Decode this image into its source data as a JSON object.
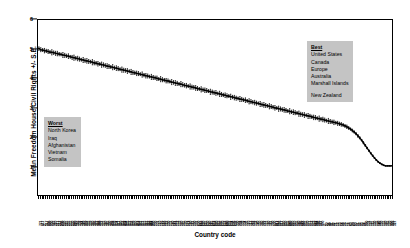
{
  "chart_data": {
    "type": "scatter",
    "title": "",
    "xlabel": "Country code",
    "ylabel": "Mean Freedom House Civil Rights +/- S.E.",
    "ylim": [
      0,
      6
    ],
    "yticks": [
      1,
      2,
      3,
      4,
      5,
      6
    ],
    "grid": false,
    "legend_position": "none",
    "n_points": 192,
    "series": [
      {
        "name": "Mean Freedom House Civil Rights +/- S.E.",
        "marker": "filled-square",
        "errorbars": true,
        "values": [
          5.02,
          4.98,
          4.97,
          4.95,
          4.94,
          4.92,
          4.9,
          4.89,
          4.88,
          4.86,
          4.85,
          4.83,
          4.82,
          4.8,
          4.79,
          4.77,
          4.76,
          4.74,
          4.72,
          4.71,
          4.69,
          4.68,
          4.66,
          4.64,
          4.63,
          4.61,
          4.6,
          4.58,
          4.57,
          4.55,
          4.53,
          4.52,
          4.5,
          4.49,
          4.47,
          4.46,
          4.44,
          4.42,
          4.41,
          4.39,
          4.38,
          4.36,
          4.35,
          4.33,
          4.31,
          4.3,
          4.28,
          4.27,
          4.25,
          4.24,
          4.22,
          4.2,
          4.19,
          4.17,
          4.16,
          4.14,
          4.13,
          4.11,
          4.09,
          4.08,
          4.06,
          4.05,
          4.03,
          4.02,
          4.0,
          3.98,
          3.97,
          3.95,
          3.94,
          3.92,
          3.91,
          3.89,
          3.87,
          3.86,
          3.84,
          3.83,
          3.81,
          3.8,
          3.78,
          3.76,
          3.75,
          3.73,
          3.72,
          3.7,
          3.69,
          3.67,
          3.65,
          3.64,
          3.62,
          3.61,
          3.59,
          3.58,
          3.56,
          3.54,
          3.53,
          3.51,
          3.5,
          3.48,
          3.47,
          3.45,
          3.43,
          3.42,
          3.4,
          3.39,
          3.37,
          3.36,
          3.34,
          3.32,
          3.31,
          3.29,
          3.28,
          3.26,
          3.25,
          3.23,
          3.21,
          3.2,
          3.18,
          3.17,
          3.15,
          3.14,
          3.12,
          3.1,
          3.09,
          3.07,
          3.06,
          3.04,
          3.03,
          3.01,
          2.99,
          2.98,
          2.96,
          2.95,
          2.93,
          2.92,
          2.9,
          2.88,
          2.87,
          2.85,
          2.84,
          2.82,
          2.81,
          2.79,
          2.77,
          2.76,
          2.74,
          2.73,
          2.71,
          2.7,
          2.68,
          2.66,
          2.65,
          2.63,
          2.62,
          2.6,
          2.59,
          2.57,
          2.55,
          2.54,
          2.52,
          2.51,
          2.49,
          2.48,
          2.46,
          2.44,
          2.42,
          2.4,
          2.37,
          2.34,
          2.3,
          2.26,
          2.21,
          2.16,
          2.1,
          2.03,
          1.96,
          1.88,
          1.79,
          1.7,
          1.61,
          1.52,
          1.43,
          1.35,
          1.27,
          1.2,
          1.14,
          1.09,
          1.05,
          1.02,
          1.0,
          1.0,
          1.0,
          1.0
        ],
        "errors": [
          0.06,
          0.07,
          0.05,
          0.08,
          0.06,
          0.07,
          0.05,
          0.09,
          0.06,
          0.07,
          0.08,
          0.06,
          0.05,
          0.09,
          0.07,
          0.06,
          0.08,
          0.05,
          0.07,
          0.09,
          0.06,
          0.08,
          0.07,
          0.05,
          0.09,
          0.06,
          0.08,
          0.07,
          0.05,
          0.09,
          0.07,
          0.06,
          0.08,
          0.05,
          0.09,
          0.07,
          0.06,
          0.08,
          0.07,
          0.05,
          0.09,
          0.06,
          0.08,
          0.07,
          0.05,
          0.09,
          0.07,
          0.06,
          0.08,
          0.05,
          0.09,
          0.07,
          0.06,
          0.08,
          0.07,
          0.05,
          0.09,
          0.06,
          0.08,
          0.07,
          0.05,
          0.09,
          0.07,
          0.06,
          0.08,
          0.05,
          0.09,
          0.07,
          0.06,
          0.08,
          0.07,
          0.05,
          0.09,
          0.06,
          0.08,
          0.07,
          0.05,
          0.09,
          0.07,
          0.06,
          0.08,
          0.05,
          0.09,
          0.07,
          0.06,
          0.08,
          0.07,
          0.05,
          0.09,
          0.06,
          0.08,
          0.07,
          0.05,
          0.09,
          0.07,
          0.06,
          0.08,
          0.05,
          0.09,
          0.07,
          0.06,
          0.08,
          0.07,
          0.05,
          0.09,
          0.06,
          0.08,
          0.07,
          0.05,
          0.09,
          0.07,
          0.06,
          0.08,
          0.05,
          0.09,
          0.07,
          0.06,
          0.08,
          0.07,
          0.05,
          0.09,
          0.06,
          0.08,
          0.07,
          0.05,
          0.09,
          0.07,
          0.06,
          0.08,
          0.05,
          0.09,
          0.07,
          0.06,
          0.08,
          0.07,
          0.05,
          0.09,
          0.06,
          0.08,
          0.07,
          0.05,
          0.09,
          0.07,
          0.06,
          0.08,
          0.05,
          0.09,
          0.07,
          0.06,
          0.08,
          0.07,
          0.05,
          0.09,
          0.06,
          0.08,
          0.07,
          0.05,
          0.09,
          0.07,
          0.06,
          0.08,
          0.05,
          0.07,
          0.06,
          0.06,
          0.05,
          0.05,
          0.06,
          0.05,
          0.04,
          0.05,
          0.04,
          0.04,
          0.05,
          0.04,
          0.03,
          0.04,
          0.03,
          0.03,
          0.02,
          0.02,
          0.02,
          0.02,
          0.01,
          0.01,
          0.01,
          0.01,
          0.01,
          0.0,
          0.0,
          0.0,
          0.0
        ]
      }
    ],
    "xtick_labels": [
      "771",
      "411",
      "2",
      "317",
      "305",
      "920",
      "900",
      "983",
      "210",
      "211",
      "212",
      "205",
      "200",
      "220",
      "225",
      "235",
      "255",
      "230",
      "290",
      "310",
      "316",
      "338",
      "344",
      "349",
      "350",
      "352",
      "355",
      "359",
      "360",
      "366",
      "367",
      "368",
      "369",
      "372",
      "375",
      "380",
      "385",
      "390",
      "395",
      "402",
      "403",
      "404",
      "411",
      "420",
      "432",
      "433",
      "434",
      "435",
      "437",
      "438",
      "439",
      "450",
      "451",
      "452",
      "461",
      "471",
      "475",
      "481",
      "482",
      "483",
      "484",
      "490",
      "500",
      "501",
      "510",
      "516",
      "517",
      "520",
      "522",
      "530",
      "531",
      "540",
      "541",
      "551",
      "552",
      "553",
      "560",
      "565",
      "570",
      "571",
      "572",
      "580",
      "581",
      "590",
      "591",
      "600",
      "615",
      "616",
      "620",
      "625",
      "630",
      "640",
      "645",
      "651",
      "652",
      "660",
      "663",
      "666",
      "670",
      "678",
      "680",
      "690",
      "692",
      "694",
      "696",
      "698",
      "700",
      "701",
      "702",
      "703",
      "704",
      "705",
      "710",
      "712",
      "713",
      "731",
      "732",
      "740",
      "750",
      "760",
      "770",
      "771",
      "775",
      "780",
      "781",
      "790",
      "800",
      "811",
      "812",
      "816",
      "817",
      "820",
      "830",
      "835",
      "840",
      "850",
      "860",
      "910",
      "935",
      "940",
      "946",
      "947",
      "950",
      "955",
      "970",
      "971",
      "972",
      "973",
      "983",
      "984",
      "986",
      "987",
      "990",
      "2",
      "20",
      "31",
      "40",
      "41",
      "42",
      "51",
      "52",
      "53",
      "54",
      "55",
      "56",
      "57",
      "58",
      "60",
      "70",
      "80",
      "90",
      "91",
      "92",
      "93",
      "94",
      "95",
      "100",
      "101",
      "110",
      "115",
      "130",
      "135",
      "140",
      "145",
      "150",
      "155",
      "160",
      "165",
      "170",
      "300",
      "325",
      "327"
    ]
  },
  "annotations": {
    "worst": {
      "header": "Worst",
      "items": [
        "North Korea",
        "Iraq",
        "Afghanistan",
        "Vietnam",
        "Somalia"
      ]
    },
    "best": {
      "header": "Best",
      "items": [
        "United States",
        "Canada",
        "Europe",
        "Australia",
        "Marshall Islands"
      ],
      "items_after_gap": [
        "New Zealand"
      ]
    }
  },
  "colors": {
    "axis": "#000000",
    "marker": "#000000",
    "annotation_background": "#c4c4c4",
    "plot_background": "#ffffff"
  }
}
